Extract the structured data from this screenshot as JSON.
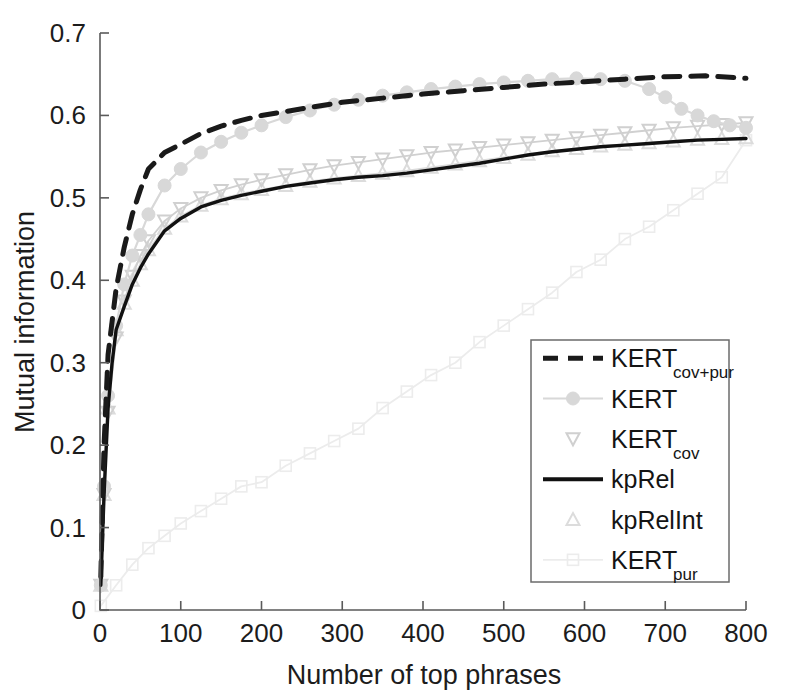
{
  "chart_data": {
    "type": "line",
    "title": "",
    "xlabel": "Number of top phrases",
    "ylabel": "Mutual information",
    "xlim": [
      0,
      800
    ],
    "ylim": [
      0,
      0.7
    ],
    "xticks": [
      0,
      100,
      200,
      300,
      400,
      500,
      600,
      700,
      800
    ],
    "xtick_labels": [
      "0",
      "100",
      "200",
      "300",
      "400",
      "500",
      "600",
      "700",
      "800"
    ],
    "yticks": [
      0,
      0.1,
      0.2,
      0.3,
      0.4,
      0.5,
      0.6,
      0.7
    ],
    "ytick_labels": [
      "0",
      "0.1",
      "0.2",
      "0.3",
      "0.4",
      "0.5",
      "0.6",
      "0.7"
    ],
    "grid": false,
    "legend_position": "lower-right",
    "series": [
      {
        "name": "KERT_cov+pur",
        "label": "KERT",
        "sublabel": "cov+pur",
        "style": "dashed",
        "color": "#1a1a1a",
        "marker": "none",
        "x": [
          1,
          5,
          10,
          20,
          30,
          40,
          50,
          60,
          80,
          100,
          125,
          150,
          175,
          200,
          250,
          300,
          350,
          400,
          450,
          500,
          550,
          600,
          650,
          700,
          750,
          800
        ],
        "y": [
          0.04,
          0.2,
          0.31,
          0.39,
          0.44,
          0.48,
          0.51,
          0.535,
          0.555,
          0.565,
          0.578,
          0.587,
          0.594,
          0.6,
          0.608,
          0.616,
          0.621,
          0.626,
          0.63,
          0.634,
          0.638,
          0.641,
          0.644,
          0.647,
          0.648,
          0.645
        ]
      },
      {
        "name": "KERT",
        "label": "KERT",
        "sublabel": "",
        "style": "solid-light",
        "color": "#d8d8d8",
        "marker": "circle",
        "x": [
          1,
          5,
          10,
          20,
          30,
          40,
          50,
          60,
          80,
          100,
          125,
          150,
          175,
          200,
          230,
          260,
          290,
          320,
          350,
          380,
          410,
          440,
          470,
          500,
          530,
          560,
          590,
          620,
          650,
          680,
          700,
          720,
          740,
          760,
          780,
          800
        ],
        "y": [
          0.03,
          0.15,
          0.26,
          0.345,
          0.395,
          0.43,
          0.455,
          0.48,
          0.515,
          0.535,
          0.555,
          0.568,
          0.579,
          0.588,
          0.598,
          0.606,
          0.613,
          0.619,
          0.624,
          0.628,
          0.632,
          0.635,
          0.638,
          0.64,
          0.642,
          0.644,
          0.645,
          0.644,
          0.642,
          0.632,
          0.622,
          0.608,
          0.6,
          0.593,
          0.588,
          0.585
        ]
      },
      {
        "name": "KERT_cov",
        "label": "KERT",
        "sublabel": "cov",
        "style": "markers-light",
        "color": "#d0d0d0",
        "marker": "triangle-down",
        "x": [
          1,
          5,
          10,
          20,
          30,
          40,
          50,
          60,
          80,
          100,
          125,
          150,
          175,
          200,
          230,
          260,
          290,
          320,
          350,
          380,
          410,
          440,
          470,
          500,
          530,
          560,
          590,
          620,
          650,
          680,
          710,
          740,
          770,
          800
        ],
        "y": [
          0.03,
          0.14,
          0.24,
          0.33,
          0.375,
          0.405,
          0.43,
          0.448,
          0.472,
          0.487,
          0.5,
          0.509,
          0.516,
          0.522,
          0.528,
          0.534,
          0.539,
          0.543,
          0.547,
          0.551,
          0.555,
          0.558,
          0.561,
          0.564,
          0.567,
          0.57,
          0.573,
          0.576,
          0.579,
          0.582,
          0.585,
          0.587,
          0.589,
          0.591
        ]
      },
      {
        "name": "kpRel",
        "label": "kpRel",
        "sublabel": "",
        "style": "solid",
        "color": "#111111",
        "marker": "none",
        "x": [
          1,
          5,
          10,
          15,
          20,
          30,
          40,
          50,
          60,
          80,
          100,
          125,
          150,
          175,
          200,
          230,
          260,
          290,
          320,
          350,
          380,
          410,
          440,
          470,
          500,
          530,
          560,
          590,
          620,
          650,
          680,
          710,
          740,
          770,
          800
        ],
        "y": [
          0.03,
          0.14,
          0.245,
          0.3,
          0.34,
          0.368,
          0.395,
          0.415,
          0.432,
          0.46,
          0.475,
          0.489,
          0.497,
          0.503,
          0.508,
          0.514,
          0.518,
          0.522,
          0.525,
          0.527,
          0.53,
          0.534,
          0.538,
          0.542,
          0.547,
          0.552,
          0.556,
          0.559,
          0.562,
          0.564,
          0.566,
          0.568,
          0.57,
          0.571,
          0.572
        ]
      },
      {
        "name": "kpRelInt",
        "label": "kpRelInt",
        "sublabel": "",
        "style": "markers-light",
        "color": "#dcdcdc",
        "marker": "triangle-up",
        "x": [
          1,
          5,
          10,
          20,
          30,
          40,
          50,
          60,
          80,
          100,
          125,
          150,
          175,
          200,
          230,
          260,
          290,
          320,
          350,
          380,
          410,
          440,
          470,
          500,
          530,
          560,
          590,
          620,
          650,
          680,
          710,
          740,
          770,
          800
        ],
        "y": [
          0.03,
          0.14,
          0.245,
          0.34,
          0.372,
          0.4,
          0.42,
          0.437,
          0.463,
          0.478,
          0.491,
          0.499,
          0.505,
          0.51,
          0.515,
          0.52,
          0.524,
          0.527,
          0.53,
          0.533,
          0.537,
          0.541,
          0.545,
          0.549,
          0.553,
          0.557,
          0.56,
          0.563,
          0.565,
          0.567,
          0.569,
          0.571,
          0.572,
          0.573
        ]
      },
      {
        "name": "KERT_pur",
        "label": "KERT",
        "sublabel": "pur",
        "style": "solid-verylight",
        "color": "#ececec",
        "marker": "square",
        "x": [
          1,
          20,
          40,
          60,
          80,
          100,
          125,
          150,
          175,
          200,
          230,
          260,
          290,
          320,
          350,
          380,
          410,
          440,
          470,
          500,
          530,
          560,
          590,
          620,
          650,
          680,
          710,
          740,
          770,
          800
        ],
        "y": [
          0.005,
          0.03,
          0.055,
          0.075,
          0.09,
          0.105,
          0.12,
          0.135,
          0.15,
          0.155,
          0.175,
          0.19,
          0.205,
          0.22,
          0.245,
          0.265,
          0.285,
          0.3,
          0.325,
          0.345,
          0.365,
          0.385,
          0.41,
          0.425,
          0.45,
          0.465,
          0.485,
          0.505,
          0.525,
          0.57
        ]
      }
    ]
  },
  "legend": {
    "entries": [
      {
        "label": "KERT",
        "sub": "cov+pur",
        "key": "KERT_cov+pur"
      },
      {
        "label": "KERT",
        "sub": "",
        "key": "KERT"
      },
      {
        "label": "KERT",
        "sub": "cov",
        "key": "KERT_cov"
      },
      {
        "label": "kpRel",
        "sub": "",
        "key": "kpRel"
      },
      {
        "label": "kpRelInt",
        "sub": "",
        "key": "kpRelInt"
      },
      {
        "label": "KERT",
        "sub": "pur",
        "key": "KERT_pur"
      }
    ]
  },
  "colors": {
    "axis": "#5a5a5a",
    "text": "#1c1c1c",
    "dark_series": "#111111",
    "light_series": "#d8d8d8",
    "very_light_series": "#ececec",
    "legend_border": "#6b6b6b",
    "background": "#ffffff"
  }
}
